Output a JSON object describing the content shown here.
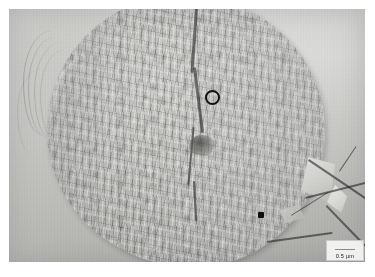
{
  "figure": {
    "type": "electron-micrograph",
    "modality": "freeze-fracture transmission electron micrograph",
    "background_tone": "#c2c2bf",
    "plate_border_color": "#ffffff"
  },
  "annotations": {
    "circle_marker": {
      "name": "open-circle-marker",
      "shape": "circle-outline",
      "color": "#101010",
      "x": 196,
      "y": 81,
      "diameter_px": 15
    },
    "dot_marker": {
      "name": "filled-dot-marker",
      "shape": "filled-square",
      "color": "#101010",
      "x": 249,
      "y": 203,
      "size_px": 6
    }
  },
  "scale_bar": {
    "label": "0.5 µm",
    "value": 0.5,
    "unit": "µm",
    "bar_color": "#3a3a3a",
    "box_background": "#f8f8f6",
    "position": "bottom-right"
  },
  "features": [
    {
      "name": "central-crack",
      "description": "dark vertical fracture line running top to bottom through the cell centre"
    },
    {
      "name": "dark-pit",
      "description": "darker depression left of centre"
    },
    {
      "name": "left-striations",
      "description": "curved parallel striations on the background at the left edge"
    },
    {
      "name": "crystal-facet",
      "description": "bright angular crystalline fragment at lower right"
    },
    {
      "name": "fracture-ridges",
      "description": "straight dark angular ridges radiating at the lower right"
    }
  ],
  "colors": {
    "background": "#c2c2bf",
    "cell_mid": "#bcbcb9",
    "highlight": "#efefec",
    "shadow": "#6e6e6c",
    "marker": "#101010"
  }
}
